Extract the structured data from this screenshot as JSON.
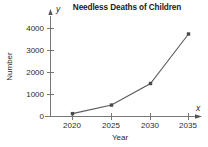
{
  "chart_data": {
    "type": "line",
    "title": "Needless Deaths of Children",
    "xlabel": "Year",
    "ylabel": "Number",
    "x_axis_variable": "x",
    "y_axis_variable": "y",
    "categories": [
      "2020",
      "2025",
      "2030",
      "2035"
    ],
    "x": [
      2020,
      2025,
      2030,
      2035
    ],
    "values": [
      130,
      520,
      1500,
      3750
    ],
    "series": [
      {
        "name": "Needless Deaths of Children",
        "values": [
          130,
          520,
          1500,
          3750
        ]
      }
    ],
    "xlim": [
      2017,
      2038
    ],
    "ylim": [
      0,
      4400
    ],
    "x_tick_labels": [
      "2020",
      "2025",
      "2030",
      "2035"
    ],
    "y_tick_labels": [
      "0",
      "1000",
      "2000",
      "3000",
      "4000"
    ],
    "y_ticks": [
      0,
      1000,
      2000,
      3000,
      4000
    ],
    "grid": false,
    "legend": false,
    "legend_position": "none",
    "marker": "square",
    "line_color": "#5a5a5a",
    "marker_color": "#4a4a4a",
    "axis_color": "#6e6e6e",
    "text_color": "#2b2b2b",
    "background": "#ffffff"
  }
}
